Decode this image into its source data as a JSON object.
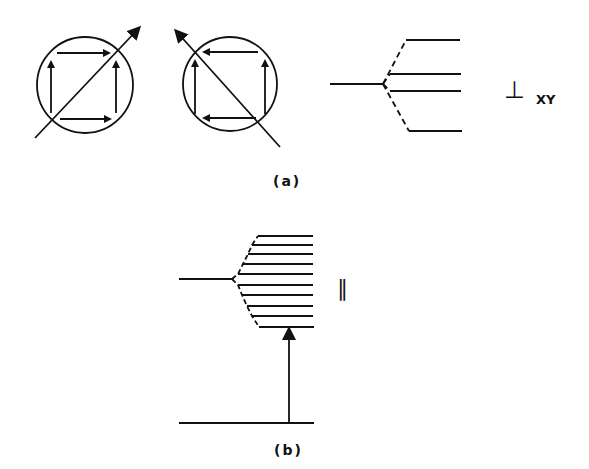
{
  "figure": {
    "panel_a": {
      "caption": "(a)",
      "left_circle": {
        "description": "circle with four arrows around a square (top and bottom pointing right, left and right pointing up) crossed by a diagonal arrow pointing up-right"
      },
      "right_circle": {
        "description": "circle with four arrows around a square (top and bottom pointing left, left and right pointing up) crossed by a diagonal arrow pointing up-left"
      },
      "energy_diagram": {
        "description": "single level splitting into 4 levels via dashed lines",
        "split_levels": 4
      },
      "polarization_symbol": "⊥",
      "polarization_subscript": "XY"
    },
    "panel_b": {
      "caption": "(b)",
      "energy_diagram": {
        "description": "single level splitting into 10 levels via dashed lines, with upward transition arrow from ground level",
        "split_levels": 10
      },
      "polarization_symbol": "∥"
    },
    "colors": {
      "ink": "#111111",
      "background": "#ffffff"
    }
  }
}
